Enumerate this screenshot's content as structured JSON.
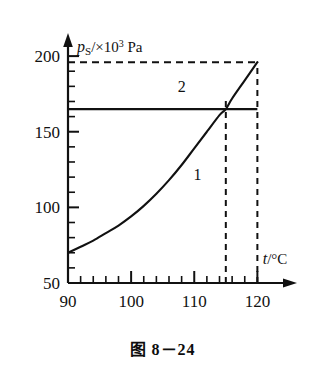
{
  "figure": {
    "caption": "图 8－24"
  },
  "chart_data": {
    "type": "line",
    "title": "",
    "xlabel": "t/°C",
    "ylabel": "pS/×10³ Pa",
    "ylabel_parts": {
      "symbol": "p",
      "subscript": "S",
      "separator": "/×10",
      "exponent": "3",
      "unit": "Pa"
    },
    "xlim": [
      90,
      122
    ],
    "ylim": [
      50,
      208
    ],
    "xticks": [
      90,
      100,
      110,
      120
    ],
    "xticklabels": [
      "90",
      "100",
      "110",
      "120"
    ],
    "x_minor_step": 2,
    "yticks": [
      50,
      100,
      150,
      200
    ],
    "yticklabels": [
      "50",
      "100",
      "150",
      "200"
    ],
    "y_minor_step": 10,
    "grid": false,
    "legend": "none",
    "series": [
      {
        "name": "1",
        "label": "1",
        "kind": "curve",
        "description": "saturated vapour pressure vs temperature",
        "label_position": {
          "x": 110.5,
          "y": 118
        },
        "x": [
          90,
          92,
          94,
          96,
          98,
          100,
          102,
          104,
          106,
          108,
          110,
          112,
          114,
          115,
          116,
          118,
          120
        ],
        "y": [
          70,
          74,
          78,
          83,
          88,
          94,
          101,
          109,
          118,
          128,
          139,
          150,
          161,
          165,
          172,
          184,
          196
        ]
      },
      {
        "name": "2",
        "label": "2",
        "kind": "horizontal-line",
        "description": "constant gas pressure line",
        "value": 165,
        "x": [
          90,
          120
        ],
        "y": [
          165,
          165
        ],
        "label_position": {
          "x": 108,
          "y": 176
        }
      }
    ],
    "annotations": [
      {
        "name": "dashed-top",
        "kind": "horizontal-dashed",
        "y": 196,
        "x_from": 90,
        "x_to": 120
      },
      {
        "name": "dashed-intersection",
        "kind": "vertical-dashed",
        "x": 115,
        "y_from": 50,
        "y_to": 173
      },
      {
        "name": "dashed-right",
        "kind": "vertical-dashed",
        "x": 120,
        "y_from": 50,
        "y_to": 196
      }
    ],
    "intersection_point": {
      "x": 115,
      "y": 165
    },
    "endpoint": {
      "x": 120,
      "y": 196
    }
  }
}
